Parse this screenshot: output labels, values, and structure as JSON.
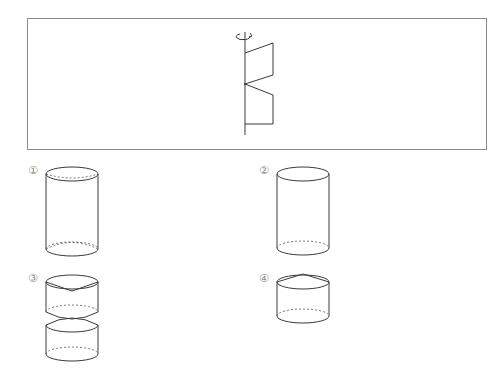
{
  "problem": {
    "figure": {
      "description": "Plane figure rotated about vertical axis",
      "rotation_arrow_icon": "rotation-arrow"
    },
    "options": [
      {
        "label": "①",
        "shape": "cylinder with concave cone hollows at top and bottom (dashed)"
      },
      {
        "label": "②",
        "shape": "plain cylinder"
      },
      {
        "label": "③",
        "shape": "two cylinders with cone hollows meeting at a point"
      },
      {
        "label": "④",
        "shape": "cylinder with cone on top"
      }
    ]
  },
  "colors": {
    "stroke": "#3a3a3a",
    "frame": "#8a8a8a",
    "label": "#888888"
  }
}
